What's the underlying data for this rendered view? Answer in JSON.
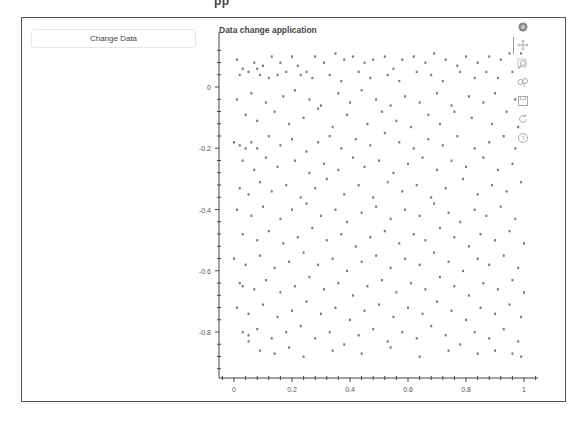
{
  "page": {
    "cropped_header_text": "pp"
  },
  "controls": {
    "change_data_button": "Change Data"
  },
  "plot": {
    "title": "Data change application",
    "marker_color": "#7a7a7a",
    "axis_color": "#444444",
    "toolbar": [
      {
        "name": "bokeh-logo-icon",
        "active": false
      },
      {
        "name": "pan-icon",
        "active": true
      },
      {
        "name": "box-zoom-icon",
        "active": false
      },
      {
        "name": "wheel-zoom-icon",
        "active": false
      },
      {
        "name": "save-icon",
        "active": false
      },
      {
        "name": "reset-icon",
        "active": false
      },
      {
        "name": "help-icon",
        "active": false
      }
    ]
  },
  "chart_data": {
    "type": "scatter",
    "title": "Data change application",
    "xlabel": "",
    "ylabel": "",
    "xlim": [
      -0.05,
      1.05
    ],
    "ylim": [
      -0.93,
      0.13
    ],
    "x_ticks": [
      "0",
      "0.2",
      "0.4",
      "0.6",
      "0.8",
      "1"
    ],
    "y_ticks": [
      "0",
      "-0.2",
      "-0.4",
      "-0.6",
      "-0.8"
    ],
    "grid": false,
    "legend": null,
    "note": "Approx. 450 uniformly scattered points with x in [0,1] and y in [-0.9,0.1]; representative sample below",
    "points": [
      [
        0.01,
        0.09
      ],
      [
        0.03,
        0.06
      ],
      [
        0.07,
        0.08
      ],
      [
        0.08,
        0.06
      ],
      [
        0.1,
        0.07
      ],
      [
        0.13,
        0.1
      ],
      [
        0.16,
        0.08
      ],
      [
        0.2,
        0.1
      ],
      [
        0.22,
        0.07
      ],
      [
        0.25,
        0.05
      ],
      [
        0.28,
        0.1
      ],
      [
        0.31,
        0.08
      ],
      [
        0.35,
        0.11
      ],
      [
        0.38,
        0.09
      ],
      [
        0.41,
        0.1
      ],
      [
        0.45,
        0.08
      ],
      [
        0.48,
        0.09
      ],
      [
        0.52,
        0.1
      ],
      [
        0.55,
        0.06
      ],
      [
        0.58,
        0.09
      ],
      [
        0.62,
        0.1
      ],
      [
        0.66,
        0.08
      ],
      [
        0.69,
        0.11
      ],
      [
        0.73,
        0.09
      ],
      [
        0.77,
        0.07
      ],
      [
        0.8,
        0.1
      ],
      [
        0.84,
        0.08
      ],
      [
        0.88,
        0.1
      ],
      [
        0.92,
        0.09
      ],
      [
        0.95,
        0.11
      ],
      [
        0.99,
        0.11
      ],
      [
        0.02,
        0.04
      ],
      [
        0.05,
        0.05
      ],
      [
        0.09,
        0.04
      ],
      [
        0.12,
        0.03
      ],
      [
        0.15,
        0.04
      ],
      [
        0.18,
        0.05
      ],
      [
        0.23,
        0.04
      ],
      [
        0.27,
        0.03
      ],
      [
        0.33,
        0.04
      ],
      [
        0.37,
        0.02
      ],
      [
        0.43,
        0.05
      ],
      [
        0.47,
        0.03
      ],
      [
        0.53,
        0.04
      ],
      [
        0.57,
        0.02
      ],
      [
        0.63,
        0.05
      ],
      [
        0.68,
        0.04
      ],
      [
        0.72,
        0.02
      ],
      [
        0.78,
        0.05
      ],
      [
        0.83,
        0.03
      ],
      [
        0.87,
        0.05
      ],
      [
        0.91,
        0.03
      ],
      [
        0.96,
        0.05
      ],
      [
        0.01,
        -0.04
      ],
      [
        0.06,
        -0.02
      ],
      [
        0.11,
        -0.05
      ],
      [
        0.17,
        -0.03
      ],
      [
        0.21,
        -0.01
      ],
      [
        0.26,
        -0.04
      ],
      [
        0.3,
        -0.06
      ],
      [
        0.36,
        -0.02
      ],
      [
        0.4,
        -0.05
      ],
      [
        0.44,
        -0.01
      ],
      [
        0.49,
        -0.04
      ],
      [
        0.54,
        -0.06
      ],
      [
        0.59,
        -0.03
      ],
      [
        0.64,
        -0.05
      ],
      [
        0.7,
        -0.02
      ],
      [
        0.75,
        -0.06
      ],
      [
        0.81,
        -0.03
      ],
      [
        0.86,
        -0.05
      ],
      [
        0.9,
        -0.02
      ],
      [
        0.97,
        -0.04
      ],
      [
        0.04,
        -0.09
      ],
      [
        0.08,
        -0.11
      ],
      [
        0.14,
        -0.08
      ],
      [
        0.19,
        -0.12
      ],
      [
        0.24,
        -0.1
      ],
      [
        0.29,
        -0.07
      ],
      [
        0.34,
        -0.13
      ],
      [
        0.39,
        -0.09
      ],
      [
        0.46,
        -0.12
      ],
      [
        0.51,
        -0.08
      ],
      [
        0.56,
        -0.11
      ],
      [
        0.61,
        -0.13
      ],
      [
        0.67,
        -0.09
      ],
      [
        0.71,
        -0.12
      ],
      [
        0.76,
        -0.08
      ],
      [
        0.82,
        -0.1
      ],
      [
        0.89,
        -0.12
      ],
      [
        0.94,
        -0.08
      ],
      [
        0.98,
        -0.13
      ],
      [
        0.0,
        -0.18
      ],
      [
        0.02,
        -0.19
      ],
      [
        0.04,
        -0.2
      ],
      [
        0.06,
        -0.18
      ],
      [
        0.08,
        -0.2
      ],
      [
        0.12,
        -0.16
      ],
      [
        0.16,
        -0.19
      ],
      [
        0.2,
        -0.17
      ],
      [
        0.25,
        -0.21
      ],
      [
        0.29,
        -0.18
      ],
      [
        0.33,
        -0.16
      ],
      [
        0.37,
        -0.2
      ],
      [
        0.42,
        -0.17
      ],
      [
        0.47,
        -0.19
      ],
      [
        0.52,
        -0.15
      ],
      [
        0.57,
        -0.18
      ],
      [
        0.62,
        -0.2
      ],
      [
        0.67,
        -0.17
      ],
      [
        0.72,
        -0.19
      ],
      [
        0.77,
        -0.16
      ],
      [
        0.83,
        -0.2
      ],
      [
        0.88,
        -0.18
      ],
      [
        0.93,
        -0.16
      ],
      [
        0.97,
        -0.2
      ],
      [
        0.03,
        -0.24
      ],
      [
        0.07,
        -0.27
      ],
      [
        0.11,
        -0.23
      ],
      [
        0.15,
        -0.26
      ],
      [
        0.21,
        -0.24
      ],
      [
        0.26,
        -0.28
      ],
      [
        0.31,
        -0.25
      ],
      [
        0.36,
        -0.27
      ],
      [
        0.41,
        -0.23
      ],
      [
        0.45,
        -0.26
      ],
      [
        0.5,
        -0.24
      ],
      [
        0.55,
        -0.28
      ],
      [
        0.6,
        -0.25
      ],
      [
        0.65,
        -0.23
      ],
      [
        0.7,
        -0.27
      ],
      [
        0.75,
        -0.24
      ],
      [
        0.8,
        -0.26
      ],
      [
        0.86,
        -0.23
      ],
      [
        0.91,
        -0.27
      ],
      [
        0.96,
        -0.25
      ],
      [
        0.02,
        -0.33
      ],
      [
        0.05,
        -0.35
      ],
      [
        0.09,
        -0.31
      ],
      [
        0.13,
        -0.34
      ],
      [
        0.18,
        -0.32
      ],
      [
        0.23,
        -0.36
      ],
      [
        0.28,
        -0.33
      ],
      [
        0.32,
        -0.3
      ],
      [
        0.38,
        -0.35
      ],
      [
        0.43,
        -0.32
      ],
      [
        0.48,
        -0.36
      ],
      [
        0.53,
        -0.31
      ],
      [
        0.58,
        -0.34
      ],
      [
        0.63,
        -0.32
      ],
      [
        0.68,
        -0.36
      ],
      [
        0.73,
        -0.33
      ],
      [
        0.79,
        -0.3
      ],
      [
        0.84,
        -0.35
      ],
      [
        0.89,
        -0.32
      ],
      [
        0.94,
        -0.34
      ],
      [
        0.99,
        -0.31
      ],
      [
        0.01,
        -0.4
      ],
      [
        0.06,
        -0.42
      ],
      [
        0.1,
        -0.39
      ],
      [
        0.16,
        -0.43
      ],
      [
        0.2,
        -0.4
      ],
      [
        0.25,
        -0.38
      ],
      [
        0.3,
        -0.42
      ],
      [
        0.35,
        -0.4
      ],
      [
        0.39,
        -0.44
      ],
      [
        0.44,
        -0.41
      ],
      [
        0.49,
        -0.39
      ],
      [
        0.54,
        -0.43
      ],
      [
        0.59,
        -0.4
      ],
      [
        0.64,
        -0.42
      ],
      [
        0.69,
        -0.38
      ],
      [
        0.74,
        -0.41
      ],
      [
        0.78,
        -0.44
      ],
      [
        0.83,
        -0.4
      ],
      [
        0.87,
        -0.42
      ],
      [
        0.92,
        -0.39
      ],
      [
        0.97,
        -0.43
      ],
      [
        0.03,
        -0.48
      ],
      [
        0.08,
        -0.5
      ],
      [
        0.12,
        -0.47
      ],
      [
        0.17,
        -0.51
      ],
      [
        0.22,
        -0.49
      ],
      [
        0.27,
        -0.46
      ],
      [
        0.32,
        -0.5
      ],
      [
        0.37,
        -0.48
      ],
      [
        0.42,
        -0.52
      ],
      [
        0.47,
        -0.49
      ],
      [
        0.52,
        -0.47
      ],
      [
        0.57,
        -0.51
      ],
      [
        0.62,
        -0.48
      ],
      [
        0.66,
        -0.5
      ],
      [
        0.71,
        -0.46
      ],
      [
        0.76,
        -0.49
      ],
      [
        0.81,
        -0.52
      ],
      [
        0.85,
        -0.48
      ],
      [
        0.9,
        -0.5
      ],
      [
        0.95,
        -0.47
      ],
      [
        1.0,
        -0.51
      ],
      [
        0.0,
        -0.56
      ],
      [
        0.04,
        -0.58
      ],
      [
        0.09,
        -0.55
      ],
      [
        0.14,
        -0.59
      ],
      [
        0.19,
        -0.57
      ],
      [
        0.24,
        -0.54
      ],
      [
        0.29,
        -0.58
      ],
      [
        0.34,
        -0.56
      ],
      [
        0.39,
        -0.6
      ],
      [
        0.44,
        -0.57
      ],
      [
        0.49,
        -0.55
      ],
      [
        0.54,
        -0.59
      ],
      [
        0.59,
        -0.56
      ],
      [
        0.64,
        -0.58
      ],
      [
        0.69,
        -0.54
      ],
      [
        0.74,
        -0.57
      ],
      [
        0.79,
        -0.6
      ],
      [
        0.84,
        -0.56
      ],
      [
        0.88,
        -0.58
      ],
      [
        0.93,
        -0.55
      ],
      [
        0.98,
        -0.59
      ],
      [
        0.02,
        -0.64
      ],
      [
        0.03,
        -0.65
      ],
      [
        0.07,
        -0.66
      ],
      [
        0.11,
        -0.63
      ],
      [
        0.16,
        -0.67
      ],
      [
        0.21,
        -0.65
      ],
      [
        0.26,
        -0.62
      ],
      [
        0.31,
        -0.66
      ],
      [
        0.36,
        -0.64
      ],
      [
        0.41,
        -0.68
      ],
      [
        0.46,
        -0.65
      ],
      [
        0.51,
        -0.63
      ],
      [
        0.56,
        -0.67
      ],
      [
        0.61,
        -0.64
      ],
      [
        0.66,
        -0.66
      ],
      [
        0.71,
        -0.62
      ],
      [
        0.76,
        -0.65
      ],
      [
        0.81,
        -0.68
      ],
      [
        0.86,
        -0.64
      ],
      [
        0.91,
        -0.66
      ],
      [
        0.96,
        -0.63
      ],
      [
        1.0,
        -0.67
      ],
      [
        0.01,
        -0.72
      ],
      [
        0.05,
        -0.74
      ],
      [
        0.1,
        -0.71
      ],
      [
        0.15,
        -0.75
      ],
      [
        0.2,
        -0.73
      ],
      [
        0.25,
        -0.7
      ],
      [
        0.3,
        -0.74
      ],
      [
        0.35,
        -0.72
      ],
      [
        0.4,
        -0.76
      ],
      [
        0.45,
        -0.73
      ],
      [
        0.5,
        -0.71
      ],
      [
        0.55,
        -0.75
      ],
      [
        0.6,
        -0.72
      ],
      [
        0.65,
        -0.74
      ],
      [
        0.7,
        -0.7
      ],
      [
        0.75,
        -0.73
      ],
      [
        0.8,
        -0.76
      ],
      [
        0.85,
        -0.72
      ],
      [
        0.9,
        -0.74
      ],
      [
        0.95,
        -0.71
      ],
      [
        0.99,
        -0.75
      ],
      [
        0.03,
        -0.8
      ],
      [
        0.05,
        -0.81
      ],
      [
        0.08,
        -0.79
      ],
      [
        0.13,
        -0.82
      ],
      [
        0.18,
        -0.8
      ],
      [
        0.23,
        -0.78
      ],
      [
        0.28,
        -0.82
      ],
      [
        0.33,
        -0.8
      ],
      [
        0.38,
        -0.84
      ],
      [
        0.43,
        -0.81
      ],
      [
        0.48,
        -0.79
      ],
      [
        0.53,
        -0.83
      ],
      [
        0.58,
        -0.8
      ],
      [
        0.63,
        -0.82
      ],
      [
        0.68,
        -0.78
      ],
      [
        0.73,
        -0.81
      ],
      [
        0.78,
        -0.84
      ],
      [
        0.83,
        -0.8
      ],
      [
        0.88,
        -0.82
      ],
      [
        0.93,
        -0.79
      ],
      [
        0.98,
        -0.83
      ],
      [
        0.05,
        -0.83
      ],
      [
        0.09,
        -0.86
      ],
      [
        0.14,
        -0.87
      ],
      [
        0.19,
        -0.85
      ],
      [
        0.24,
        -0.88
      ],
      [
        0.34,
        -0.86
      ],
      [
        0.44,
        -0.87
      ],
      [
        0.54,
        -0.85
      ],
      [
        0.64,
        -0.88
      ],
      [
        0.74,
        -0.86
      ],
      [
        0.84,
        -0.87
      ],
      [
        0.9,
        -0.86
      ],
      [
        0.96,
        -0.87
      ],
      [
        0.99,
        -0.88
      ]
    ]
  }
}
